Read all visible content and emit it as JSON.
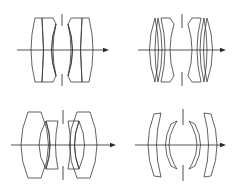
{
  "figure": {
    "type": "optical lens cross-section diagrams",
    "panel_count": 4,
    "line_color": "#3a3a3a",
    "background": "#ffffff",
    "panels": [
      {
        "id": "top-left",
        "description": "Double-Gauss type: positive front singlet + cemented negative meniscus doublet, stop, mirrored rear group",
        "elements": 6
      },
      {
        "id": "top-right",
        "description": "Double-Gauss variant with thin positive front elements and cemented meniscus doublets",
        "elements": 6
      },
      {
        "id": "bottom-left",
        "description": "Double-Gauss type with large biconvex outer elements and cemented biconcave inner elements",
        "elements": 6
      },
      {
        "id": "bottom-right",
        "description": "Symmetric four-meniscus (Topogon-like) design with stop at center",
        "elements": 4
      }
    ]
  }
}
